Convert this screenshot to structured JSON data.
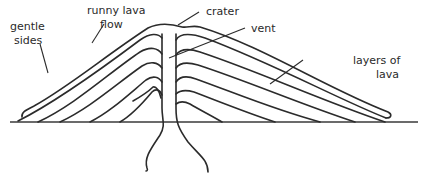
{
  "diagram": {
    "labels": {
      "gentle_sides_line1": "gentle",
      "gentle_sides_line2": "sides",
      "runny_lava_line1": "runny lava",
      "runny_lava_line2": "flow",
      "crater": "crater",
      "vent": "vent",
      "layers_line1": "layers of",
      "layers_line2": "lava"
    },
    "colors": {
      "line": "#2b2b2b",
      "text": "#2a2a2a",
      "background": "#ffffff"
    }
  }
}
